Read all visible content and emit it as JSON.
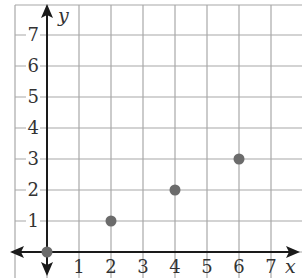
{
  "chart_data": {
    "type": "scatter",
    "title": "",
    "xlabel": "x",
    "ylabel": "y",
    "xlim": [
      -1,
      7.9
    ],
    "ylim": [
      -0.8,
      7.5
    ],
    "grid": true,
    "legend": null,
    "x_ticks": [
      "1",
      "2",
      "3",
      "4",
      "5",
      "6",
      "7"
    ],
    "y_ticks": [
      "1",
      "2",
      "3",
      "4",
      "5",
      "6",
      "7"
    ],
    "series": [
      {
        "name": "points",
        "points": [
          {
            "x": 0,
            "y": 0
          },
          {
            "x": 2,
            "y": 1
          },
          {
            "x": 4,
            "y": 2
          },
          {
            "x": 6,
            "y": 3
          }
        ]
      }
    ]
  },
  "colors": {
    "grid": "#a8a8a8",
    "axis": "#1a1a1a",
    "point": "#6b6b6b",
    "text": "#333333"
  }
}
